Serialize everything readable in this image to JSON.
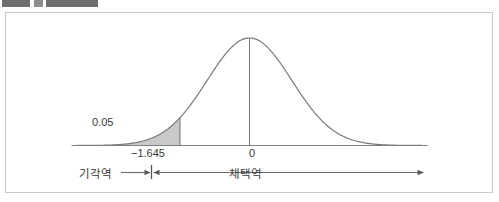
{
  "panel": {
    "name": "figure-panel"
  },
  "toolbar_remnant": {
    "visible": true
  },
  "figure": {
    "alpha_label": "0.05",
    "critical_value_label": "−1.645",
    "center_label": "0",
    "rejection_region_label": "기각역",
    "acceptance_region_label": "채택역",
    "colors": {
      "curve": "#7a7a7a",
      "axis": "#808080",
      "shade_fill": "#c9c9c9",
      "text": "#3a3a3a",
      "panel_border": "#c8c8c8",
      "remnant": "#6e6e6e"
    }
  },
  "chart_data": {
    "type": "line",
    "title": "",
    "subtitle": "",
    "xlabel": "",
    "ylabel": "",
    "grid": false,
    "legend": "none",
    "distribution": "standard normal",
    "mean": 0,
    "sd": 1,
    "xlim": [
      -4.2,
      4.2
    ],
    "ylim": [
      0,
      0.42
    ],
    "tick_values": [
      -1.645,
      0
    ],
    "tick_labels": [
      "−1.645",
      "0"
    ],
    "annotations": [
      {
        "text": "0.05",
        "x": -2.2,
        "y": 0.08,
        "role": "tail-area-label"
      },
      {
        "text": "기각역",
        "x": -2.9,
        "y": -0.09,
        "role": "rejection-region"
      },
      {
        "text": "채택역",
        "x": 0.05,
        "y": -0.09,
        "role": "acceptance-region"
      }
    ],
    "shaded_region": {
      "from": -4.2,
      "to": -1.645,
      "area": 0.05,
      "label": "0.05",
      "fill": "#c9c9c9"
    },
    "vertical_lines": [
      {
        "x": -1.645,
        "from_y": 0,
        "to_y": 0.103
      },
      {
        "x": 0,
        "from_y": 0,
        "to_y": 0.399
      }
    ],
    "region_arrows": [
      {
        "name": "rejection-arrow",
        "direction": "left",
        "from_x": -1.645,
        "to_x": -3.05
      },
      {
        "name": "acceptance-arrow",
        "direction": "right",
        "from_x": -1.645,
        "to_x": 4.15
      }
    ],
    "x": [
      -4.2,
      -4.0,
      -3.8,
      -3.6,
      -3.4,
      -3.2,
      -3.0,
      -2.8,
      -2.6,
      -2.4,
      -2.2,
      -2.0,
      -1.8,
      -1.645,
      -1.6,
      -1.4,
      -1.2,
      -1.0,
      -0.8,
      -0.6,
      -0.4,
      -0.2,
      0.0,
      0.2,
      0.4,
      0.6,
      0.8,
      1.0,
      1.2,
      1.4,
      1.6,
      1.8,
      2.0,
      2.2,
      2.4,
      2.6,
      2.8,
      3.0,
      3.2,
      3.4,
      3.6,
      3.8,
      4.0,
      4.2
    ],
    "y": [
      0.0001,
      0.0001,
      0.0003,
      0.0006,
      0.0012,
      0.0024,
      0.0044,
      0.0079,
      0.0136,
      0.0224,
      0.0355,
      0.054,
      0.079,
      0.1031,
      0.1109,
      0.1497,
      0.1942,
      0.242,
      0.2897,
      0.3332,
      0.3683,
      0.391,
      0.3989,
      0.391,
      0.3683,
      0.3332,
      0.2897,
      0.242,
      0.1942,
      0.1497,
      0.1109,
      0.079,
      0.054,
      0.0355,
      0.0224,
      0.0136,
      0.0079,
      0.0044,
      0.0024,
      0.0012,
      0.0006,
      0.0003,
      0.0001,
      0.0001
    ]
  }
}
